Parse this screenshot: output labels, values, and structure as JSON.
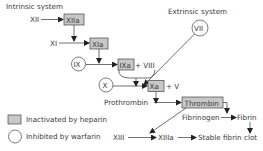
{
  "labels": {
    "intrinsic": "Intrinsic system",
    "extrinsic": "Extrinsic system"
  },
  "nodes": {
    "xii": "XII",
    "xiia": "XIIa",
    "xi": "XI",
    "xia": "XIa",
    "ix": "IX",
    "ixa": "IXa",
    "viii": "+ VIII",
    "vii": "VII",
    "x": "X",
    "xa": "Xa",
    "v": "+ V",
    "prothrombin": "Prothrombin",
    "thrombin": "Thrombin",
    "fibrinogen": "Fibrinogen",
    "fibrin": "Fibrin",
    "xiii": "XIII",
    "xiiia": "XIIIa",
    "clot": "Stable fibrin clot"
  },
  "legend": {
    "heparin": "Inactivated by heparin",
    "warfarin": "Inhibited by warfarin"
  },
  "colors": {
    "box_fill": "#c8c8c8",
    "line": "#333333",
    "text": "#3a3a3a"
  }
}
